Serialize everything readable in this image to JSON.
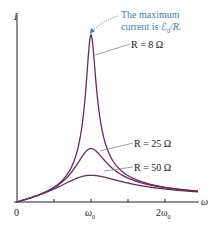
{
  "chart_data": {
    "type": "line",
    "title": "",
    "xlabel": "ω",
    "ylabel": "I",
    "x_ticks": [
      "0",
      "ω0",
      "2ω0"
    ],
    "x_tick_positions": [
      0,
      1,
      2
    ],
    "xlim": [
      0,
      2.45
    ],
    "ylim": [
      0,
      1.0
    ],
    "grid": false,
    "legend_position": "inline labels",
    "series": [
      {
        "name": "R = 8 Ω",
        "R": 8,
        "peak_relative": 1.0
      },
      {
        "name": "R = 25 Ω",
        "R": 25,
        "peak_relative": 0.32
      },
      {
        "name": "R = 50 Ω",
        "R": 50,
        "peak_relative": 0.16
      }
    ],
    "annotations": [
      {
        "text": "The maximum current is ℰ0/R.",
        "points_to": "peak of R = 8 Ω curve"
      }
    ],
    "colors": {
      "curves": "#6b2a5e",
      "annotation": "#3a7bb5",
      "axis": "#222222"
    }
  },
  "labels": {
    "y_axis": "I",
    "x_axis": "ω",
    "tick_0": "0",
    "tick_w0": "ω",
    "tick_w0_sub": "0",
    "tick_2w0": "2ω",
    "tick_2w0_sub": "0",
    "r8": "R = 8 Ω",
    "r25": "R = 25 Ω",
    "r50": "R = 50 Ω",
    "note_line1": "The maximum",
    "note_line2": "current is ℰ",
    "note_sub": "0",
    "note_tail": "/R."
  }
}
